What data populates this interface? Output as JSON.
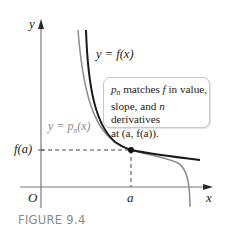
{
  "figure": {
    "caption": "FIGURE 9.4",
    "axes": {
      "x_label": "x",
      "y_label": "y",
      "origin_label": "O",
      "x_tick_label": "a",
      "y_tick_label": "f(a)"
    },
    "curves": [
      {
        "name": "f",
        "label_prefix": "y = ",
        "label_func": "f(x)",
        "color": "#1a1a1a"
      },
      {
        "name": "p_n",
        "label_prefix": "y = ",
        "label_func_base": "p",
        "label_func_sub": "n",
        "label_func_tail": "(x)",
        "color": "#8c8c8c"
      }
    ],
    "callout": {
      "line1_sym": "p",
      "line1_sub": "n",
      "line1_mid": " matches ",
      "line1_f": "f",
      "line1_end": " in value,",
      "line2_a": "slope, and ",
      "line2_n": "n",
      "line2_b": " derivatives",
      "line3": "at (a, f(a))."
    },
    "point": {
      "label": "(a, f(a))"
    },
    "colors": {
      "axis": "#7a7a7a",
      "f_curve": "#1a1a1a",
      "p_curve": "#8c8c8c",
      "dashed": "#333333",
      "caption": "#8a8a8a"
    }
  }
}
